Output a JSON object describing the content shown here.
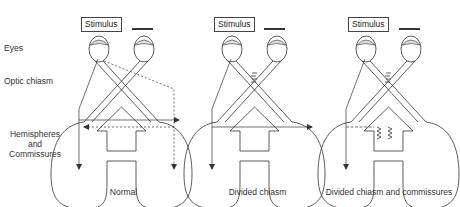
{
  "labels": {
    "eyes": "Eyes",
    "optic_chiasm": "Optic chiasm",
    "hemispheres_line1": "Hemispheres",
    "hemispheres_line2": "and",
    "hemispheres_line3": "Commissures"
  },
  "panels": [
    {
      "stimulus": "Stimulus",
      "caption": "Normal"
    },
    {
      "stimulus": "Stimulus",
      "caption": "Divided chiasm"
    },
    {
      "stimulus": "Stimulus",
      "caption": "Divided chiasm and commissures"
    }
  ],
  "colors": {
    "line": "#333333",
    "background": "#ffffff"
  }
}
